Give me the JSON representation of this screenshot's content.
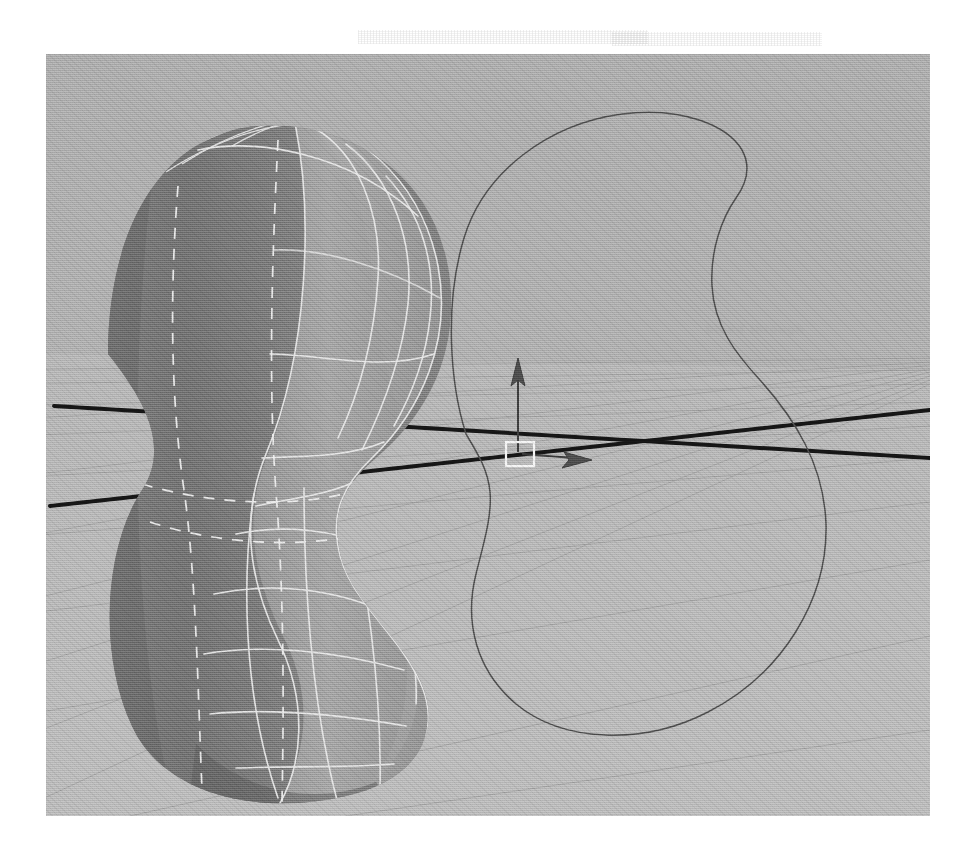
{
  "application": {
    "kind": "3d-modeling-viewport",
    "view_label": "perspective"
  },
  "canvas": {
    "width": 974,
    "height": 858,
    "paper_color": "#ffffff"
  },
  "viewport": {
    "x": 46,
    "y": 54,
    "width": 884,
    "height": 762,
    "sky_color": "#ababab",
    "ground_color": "#b4b4b4",
    "grid_line_color": "#9b9b9b",
    "axis_line_color": "#151515",
    "curve_color": "#4a4a4a"
  },
  "ghost_text": {
    "watermark": "bleed through"
  },
  "model": {
    "name": "revolved-peanut-surface",
    "shading": "smooth-shaded-with-wireframe",
    "face_dark": "#6e6e6e",
    "face_mid": "#8a8a8a",
    "face_light": "#a2a2a2",
    "face_deep": "#5a5a5a",
    "wireframe_color": "#e8e8e8",
    "hidden_wire_style": "dashed",
    "silhouette_color": "#f2f2f2"
  },
  "profile_curve": {
    "name": "nurbs-profile-curve",
    "stroke": "#4a4a4a",
    "stroke_width": 1.4,
    "closed": true
  },
  "manipulator": {
    "name": "move-manipulator",
    "origin_handle_color": "#f4f4f4",
    "axis_y_color": "#3a3a3a",
    "axis_x_color": "#3a3a3a",
    "axes": [
      {
        "axis": "Y",
        "direction": "up",
        "label": "y-axis-arrow"
      },
      {
        "axis": "X",
        "direction": "right",
        "label": "x-axis-arrow"
      }
    ]
  },
  "world_axes": [
    {
      "name": "axis-line-z",
      "color": "#151515"
    },
    {
      "name": "axis-line-x",
      "color": "#151515"
    }
  ],
  "grid": {
    "name": "ground-grid",
    "divisions_u": 11,
    "divisions_v": 9,
    "color": "#9b9b9b"
  }
}
